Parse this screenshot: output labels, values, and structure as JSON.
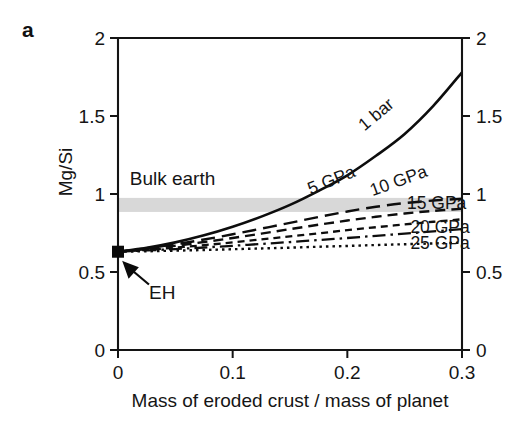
{
  "panel": {
    "label": "a"
  },
  "chart_data": {
    "type": "line",
    "title": "",
    "xlabel": "Mass of eroded crust / mass of planet",
    "ylabel": "Mg/Si",
    "xlim": [
      0,
      0.3
    ],
    "ylim": [
      0,
      2
    ],
    "xticks": [
      0,
      0.1,
      0.2,
      0.3
    ],
    "xticklabels": [
      "0",
      "0.1",
      "0.2",
      "0.3"
    ],
    "yticks": [
      0,
      0.5,
      1,
      1.5,
      2
    ],
    "yticklabels": [
      "0",
      "0.5",
      "1",
      "1.5",
      "2"
    ],
    "right_axis_ticklabels": [
      "0",
      "0.5",
      "1",
      "1.5",
      "2"
    ],
    "grid": false,
    "legend_position": "inline-curve-labels",
    "series": [
      {
        "name": "1 bar",
        "label": "1 bar",
        "style": "solid",
        "dasharray": "none",
        "width": 2.6,
        "label_rotation": -40,
        "label_x": 0.215,
        "label_y": 1.4,
        "x": [
          0,
          0.025,
          0.05,
          0.075,
          0.1,
          0.125,
          0.15,
          0.175,
          0.2,
          0.225,
          0.25,
          0.275,
          0.3
        ],
        "values": [
          0.63,
          0.655,
          0.69,
          0.735,
          0.79,
          0.855,
          0.93,
          1.02,
          1.12,
          1.245,
          1.385,
          1.565,
          1.78
        ]
      },
      {
        "name": "5 GPa",
        "label": "5 GPa",
        "style": "long-dash",
        "dasharray": "14,7",
        "width": 2.4,
        "label_rotation": -22,
        "label_x": 0.168,
        "label_y": 0.995,
        "x": [
          0,
          0.025,
          0.05,
          0.075,
          0.1,
          0.125,
          0.15,
          0.175,
          0.2,
          0.225,
          0.25,
          0.275,
          0.3
        ],
        "values": [
          0.63,
          0.652,
          0.678,
          0.708,
          0.742,
          0.778,
          0.815,
          0.853,
          0.888,
          0.918,
          0.942,
          0.958,
          0.97
        ]
      },
      {
        "name": "10 GPa",
        "label": "10 GPa",
        "style": "medium-dash",
        "dasharray": "10,6",
        "width": 2.4,
        "label_rotation": -20,
        "label_x": 0.222,
        "label_y": 0.985,
        "x": [
          0,
          0.025,
          0.05,
          0.075,
          0.1,
          0.125,
          0.15,
          0.175,
          0.2,
          0.225,
          0.25,
          0.275,
          0.3
        ],
        "values": [
          0.63,
          0.648,
          0.668,
          0.692,
          0.718,
          0.746,
          0.775,
          0.803,
          0.83,
          0.854,
          0.875,
          0.892,
          0.905
        ]
      },
      {
        "name": "15 GPa",
        "label": "15 GPa",
        "style": "short-dash",
        "dasharray": "7,5",
        "width": 2.3,
        "label_rotation": 0,
        "label_x": 0.252,
        "label_y": 0.905,
        "x": [
          0,
          0.025,
          0.05,
          0.075,
          0.1,
          0.125,
          0.15,
          0.175,
          0.2,
          0.225,
          0.25,
          0.275,
          0.3
        ],
        "values": [
          0.63,
          0.642,
          0.656,
          0.672,
          0.69,
          0.709,
          0.728,
          0.748,
          0.768,
          0.787,
          0.805,
          0.822,
          0.838
        ]
      },
      {
        "name": "20 GPa",
        "label": "20 GPa",
        "style": "dash-dot",
        "dasharray": "13,5,2.5,5",
        "width": 2.3,
        "label_rotation": 0,
        "label_x": 0.255,
        "label_y": 0.752,
        "x": [
          0,
          0.025,
          0.05,
          0.075,
          0.1,
          0.125,
          0.15,
          0.175,
          0.2,
          0.225,
          0.25,
          0.275,
          0.3
        ],
        "values": [
          0.63,
          0.638,
          0.647,
          0.657,
          0.668,
          0.68,
          0.692,
          0.705,
          0.718,
          0.732,
          0.746,
          0.76,
          0.775
        ]
      },
      {
        "name": "25 GPa",
        "label": "25 GPa",
        "style": "dotted",
        "dasharray": "2.5,4",
        "width": 2.4,
        "label_rotation": 0,
        "label_x": 0.255,
        "label_y": 0.648,
        "x": [
          0,
          0.025,
          0.05,
          0.075,
          0.1,
          0.125,
          0.15,
          0.175,
          0.2,
          0.225,
          0.25,
          0.275,
          0.3
        ],
        "values": [
          0.63,
          0.633,
          0.637,
          0.641,
          0.646,
          0.651,
          0.656,
          0.662,
          0.667,
          0.673,
          0.678,
          0.683,
          0.688
        ]
      }
    ],
    "band": {
      "label": "Bulk earth",
      "y_low": 0.885,
      "y_high": 0.975,
      "color": "#d8d8d8",
      "label_x": 0.005,
      "label_y": 1.055
    },
    "markers": [
      {
        "label": "EH",
        "x": 0,
        "y": 0.63,
        "shape": "square",
        "annotation_x": 0.027,
        "annotation_y": 0.33
      }
    ]
  }
}
